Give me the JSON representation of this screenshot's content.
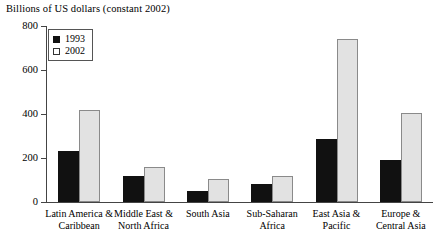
{
  "chart_data": {
    "type": "bar",
    "title": "Billions of US dollars (constant 2002)",
    "xlabel": "",
    "ylabel": "",
    "ylim": [
      0,
      800
    ],
    "yticks": [
      0,
      200,
      400,
      600,
      800
    ],
    "grid": false,
    "legend_position": "top-left",
    "categories": [
      "Latin America &\nCaribbean",
      "Middle East &\nNorth Africa",
      "South Asia",
      "Sub-Saharan\nAfrica",
      "East Asia &\nPacific",
      "Europe &\nCentral Asia"
    ],
    "series": [
      {
        "name": "1993",
        "color": "#111111",
        "values": [
          230,
          118,
          50,
          82,
          285,
          193
        ]
      },
      {
        "name": "2002",
        "color": "#e2e2e2",
        "values": [
          420,
          158,
          105,
          118,
          740,
          405
        ]
      }
    ]
  },
  "axis": {
    "tick_labels": [
      "800",
      "600",
      "400",
      "200",
      "0"
    ]
  },
  "legend": {
    "entries": [
      {
        "label": "1993",
        "swatch": "filled-square-icon"
      },
      {
        "label": "2002",
        "swatch": "hollow-square-icon"
      }
    ]
  }
}
